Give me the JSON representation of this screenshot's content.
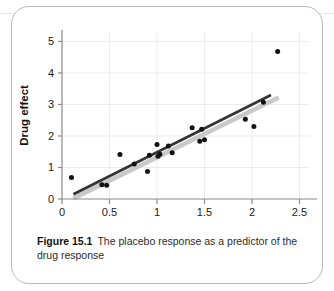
{
  "figure": {
    "label": "Figure 15.1",
    "caption": "The placebo response as a predictor of the drug response"
  },
  "colors": {
    "point": "#111111",
    "regression_line": "#333333",
    "confidence_band": "#c9c9c9",
    "axis": "#8a8a8a",
    "grid": "#ececec",
    "card_border": "#b9b9b9",
    "background": "#ffffff"
  },
  "chart_data": {
    "type": "scatter",
    "title": "",
    "xlabel": "Placebo effect",
    "ylabel": "Drug effect",
    "xlim": [
      0,
      2.6
    ],
    "ylim": [
      0,
      5.3
    ],
    "xticks": [
      0,
      0.5,
      1,
      1.5,
      2,
      2.5
    ],
    "xtick_labels": [
      "0",
      "0.5",
      "1",
      "1.5",
      "2",
      "2.5"
    ],
    "yticks": [
      0,
      1,
      2,
      3,
      4,
      5
    ],
    "ytick_labels": [
      "0",
      "1",
      "2",
      "3",
      "4",
      "5"
    ],
    "grid": true,
    "legend": null,
    "points": [
      {
        "x": 0.1,
        "y": 0.68
      },
      {
        "x": 0.42,
        "y": 0.45
      },
      {
        "x": 0.47,
        "y": 0.44
      },
      {
        "x": 0.61,
        "y": 1.41
      },
      {
        "x": 0.76,
        "y": 1.11
      },
      {
        "x": 0.9,
        "y": 0.87
      },
      {
        "x": 0.92,
        "y": 1.39
      },
      {
        "x": 1.0,
        "y": 1.73
      },
      {
        "x": 1.01,
        "y": 1.36
      },
      {
        "x": 1.03,
        "y": 1.42
      },
      {
        "x": 1.12,
        "y": 1.68
      },
      {
        "x": 1.16,
        "y": 1.47
      },
      {
        "x": 1.37,
        "y": 2.26
      },
      {
        "x": 1.45,
        "y": 1.83
      },
      {
        "x": 1.47,
        "y": 2.21
      },
      {
        "x": 1.5,
        "y": 1.88
      },
      {
        "x": 1.93,
        "y": 2.53
      },
      {
        "x": 2.02,
        "y": 2.3
      },
      {
        "x": 2.12,
        "y": 3.07
      },
      {
        "x": 2.27,
        "y": 4.68
      }
    ],
    "regression_line": {
      "x_start": 0.12,
      "y_start": 0.15,
      "x_end": 2.2,
      "y_end": 3.3
    },
    "confidence_band": {
      "x_start": 0.12,
      "y_start": 0.02,
      "x_end": 2.28,
      "y_end": 3.22
    }
  }
}
